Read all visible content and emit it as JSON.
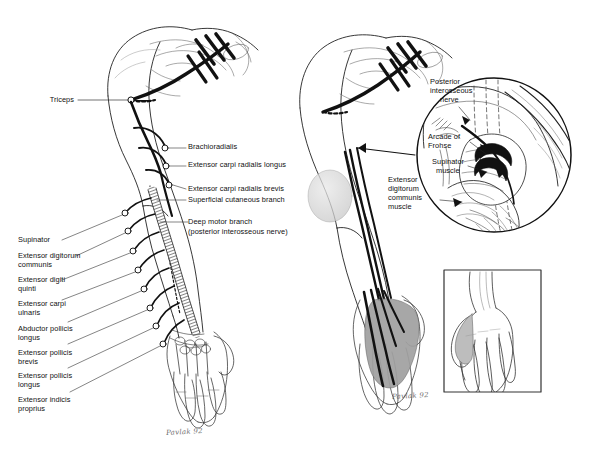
{
  "figure": {
    "background_color": "#ffffff",
    "ink_color": "#141414",
    "shade_color": "#9a9a9a",
    "light_shade_color": "#d5d5d5"
  },
  "left_panel": {
    "name": "Posterior view of arm with radial nerve branches",
    "labels_right": [
      {
        "id": "brachioradialis",
        "text": "Brachioradialis"
      },
      {
        "id": "ecrl",
        "text": "Extensor carpi radialis longus"
      },
      {
        "id": "ecrb",
        "text": "Extensor carpi radialis brevis"
      },
      {
        "id": "superficial-cutaneous-branch",
        "text": "Superficial cutaneous branch"
      },
      {
        "id": "deep-motor-branch",
        "text": "Deep motor branch"
      },
      {
        "id": "deep-motor-branch-sub",
        "text": "(posterior interosseous nerve)"
      }
    ],
    "label_triceps": "Triceps",
    "labels_left": [
      {
        "id": "supinator",
        "line1": "Supinator",
        "line2": ""
      },
      {
        "id": "extensor-digitorum-communis",
        "line1": "Extensor digitorum",
        "line2": "communis"
      },
      {
        "id": "extensor-digiti-quinti",
        "line1": "Extensor digiti",
        "line2": "quinti"
      },
      {
        "id": "extensor-carpi-ulnaris",
        "line1": "Extensor carpi",
        "line2": "ulnaris"
      },
      {
        "id": "abductor-pollicis-longus",
        "line1": "Abductor pollicis",
        "line2": "longus"
      },
      {
        "id": "extensor-pollicis-brevis",
        "line1": "Extensor pollicis",
        "line2": "brevis"
      },
      {
        "id": "extensor-pollicis-longus",
        "line1": "Extensor pollicis",
        "line2": "longus"
      },
      {
        "id": "extensor-indicis-proprius",
        "line1": "Extensor indicis",
        "line2": "proprius"
      }
    ],
    "signature": "Pavlak 92"
  },
  "right_panel": {
    "name": "Arm with magnified supinator region and sensory distribution",
    "magnified_inset_labels": [
      {
        "id": "posterior-interosseous-nerve",
        "line1": "Posterior",
        "line2": "interosseous",
        "line3": "nerve"
      },
      {
        "id": "arcade-of-frohse",
        "line1": "Arcade of",
        "line2": "Frohse",
        "line3": ""
      },
      {
        "id": "supinator-muscle",
        "line1": "Supinator",
        "line2": "muscle",
        "line3": ""
      }
    ],
    "label_edc_muscle": {
      "id": "extensor-digitorum-communis-muscle",
      "line1": "Extensor",
      "line2": "digitorum",
      "line3": "communis",
      "line4": "muscle"
    },
    "signature": "Pavlak 92"
  },
  "hand_inset": {
    "name": "Dorsal hand sensory distribution inset",
    "border_color": "#333333"
  }
}
